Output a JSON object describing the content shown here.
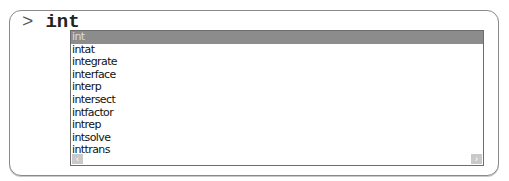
{
  "prompt": {
    "symbol": ">",
    "input": "int"
  },
  "autocomplete": {
    "selected_index": 0,
    "items": [
      "int",
      "intat",
      "integrate",
      "interface",
      "interp",
      "intersect",
      "intfactor",
      "intrep",
      "intsolve",
      "inttrans"
    ],
    "scroll_left_glyph": "‹",
    "scroll_right_glyph": "›"
  }
}
